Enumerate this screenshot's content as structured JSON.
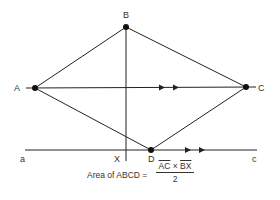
{
  "diagram": {
    "points": {
      "A": {
        "label": "A",
        "x": 35,
        "y": 88
      },
      "B": {
        "label": "B",
        "x": 126,
        "y": 27
      },
      "C": {
        "label": "C",
        "x": 246,
        "y": 87
      },
      "D": {
        "label": "D",
        "x": 151,
        "y": 150
      }
    },
    "line_labels": {
      "a": "a",
      "c": "c",
      "X": "X"
    },
    "stroke_color": "#222222",
    "formula": {
      "prefix": "Area of ABCD =",
      "numerator_left": "AC",
      "operator": "×",
      "numerator_right": "BX",
      "denominator": "2"
    }
  }
}
